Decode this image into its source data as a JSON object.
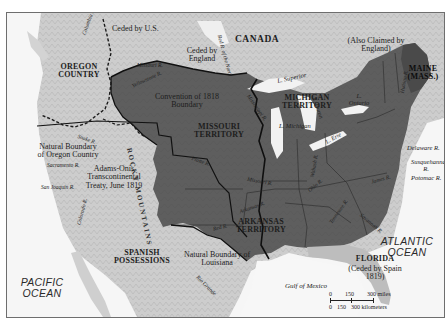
{
  "map": {
    "title_regions": {
      "canada": "CANADA",
      "oregon_country": "OREGON COUNTRY",
      "oregon_note": "Joint Occupation by England and U.S. (Convention of 1818)",
      "missouri_territory": "MISSOURI TERRITORY",
      "michigan_territory": "MICHIGAN TERRITORY",
      "arkansas_territory": "ARKANSAS TERRITORY",
      "spanish_possessions": "SPANISH POSSESSIONS",
      "maine": "MAINE (MASS.)",
      "florida": "FLORIDA",
      "florida_note": "(Ceded by Spain 1819)"
    },
    "annotations": {
      "ceded_by_us": "Ceded by U.S.",
      "ceded_by_england": "Ceded by England",
      "also_claimed": "(Also Claimed by England)",
      "convention_1818": "Convention of 1818 Boundary",
      "natural_boundary_oregon": "Natural Boundary of Oregon Country",
      "adams_onis": "Adams-Onís Transcontinental Treaty, June 1819",
      "natural_boundary_louisiana": "Natural Boundary of Louisiana",
      "rocky_mountains": "ROCKY MOUNTAINS"
    },
    "water": {
      "pacific": "PACIFIC OCEAN",
      "atlantic": "ATLANTIC OCEAN",
      "gulf": "Gulf of Mexico",
      "superior": "L. Superior",
      "michigan": "L. Michigan",
      "huron": "L. Huron",
      "erie": "L. Erie",
      "ontario": "L. Ontario"
    },
    "rivers": {
      "columbia": "Columbia R.",
      "columbia_south": "Colorado R.",
      "snake": "Snake R.",
      "sacramento": "Sacramento R.",
      "san_joaquin": "San Joaquin R.",
      "missouri_upper": "Missouri R.",
      "yellowstone": "Yellowstone R.",
      "red_river_north": "Red R. of the North",
      "mississippi": "Mississippi R.",
      "platte": "Platte R.",
      "missouri": "Missouri R.",
      "arkansas": "Arkansas R.",
      "red": "Red R.",
      "rio_grande": "Rio Grande",
      "ohio": "Ohio R.",
      "wabash": "Wabash R.",
      "tennessee": "Tennessee R.",
      "savannah": "Savannah R.",
      "james": "James R.",
      "delaware": "Delaware R.",
      "susquehanna": "Susquehanna R.",
      "potomac": "Potomac R.",
      "hudson": "Hudson R."
    },
    "scale": {
      "miles_0": "0",
      "miles_150": "150",
      "miles_300": "300 miles",
      "km_0": "0",
      "km_150": "150",
      "km_300": "300 kilometers"
    },
    "colors": {
      "us_territory": "#5c5c5c",
      "land": "#cfcfcf",
      "water": "#f7f7f7",
      "foreign": "#bdbdbd",
      "border": "#111111"
    }
  }
}
